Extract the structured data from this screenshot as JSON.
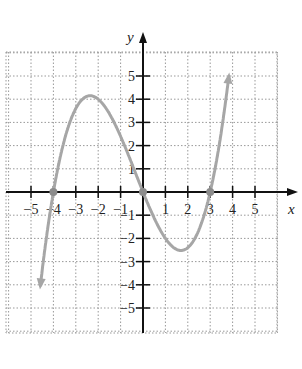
{
  "chart_data": {
    "type": "line",
    "title": "",
    "xlabel": "x",
    "ylabel": "y",
    "xlim": [
      -6,
      6
    ],
    "ylim": [
      -6,
      6
    ],
    "grid": true,
    "x_ticks": [
      -5,
      -4,
      -3,
      -2,
      -1,
      1,
      2,
      3,
      4,
      5
    ],
    "y_ticks": [
      -5,
      -4,
      -3,
      -2,
      -1,
      1,
      2,
      3,
      4,
      5
    ],
    "x_tick_labels": [
      "−5",
      "−4",
      "−3",
      "−2",
      "−1",
      "1",
      "2",
      "3",
      "4",
      "5"
    ],
    "y_tick_labels": [
      "−5",
      "−4",
      "−3",
      "−2",
      "−1",
      "1",
      "2",
      "3",
      "4",
      "5"
    ],
    "series": [
      {
        "name": "f(x) = 0.2x(x+4)(x−3)",
        "color": "#a6a6a6",
        "x": [
          -4.6,
          -4,
          -3,
          -2.2,
          -2,
          -1,
          0,
          1,
          1.7,
          2,
          3,
          3.8
        ],
        "y": [
          -6.0,
          0,
          3.6,
          4.1,
          4.0,
          2.4,
          0,
          -2.0,
          -2.5,
          -2.4,
          0,
          5.8
        ]
      }
    ],
    "annotations": [
      {
        "type": "point",
        "x": -4,
        "y": 0
      },
      {
        "type": "point",
        "x": 0,
        "y": 0
      },
      {
        "type": "point",
        "x": 3,
        "y": 0
      }
    ]
  },
  "labels": {
    "x": "x",
    "y": "y"
  }
}
